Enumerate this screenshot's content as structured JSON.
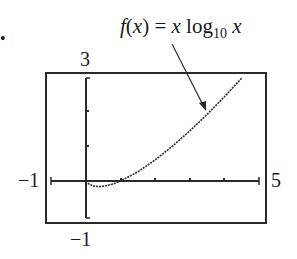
{
  "figure": {
    "bullet": "•",
    "annotation": {
      "func_name": "f",
      "var": "x",
      "equals": " = ",
      "log_text": "log",
      "log_base": "10",
      "text": "f(x) = x log10 x"
    },
    "labels": {
      "ymax": "3",
      "ymin": "−1",
      "xmin": "−1",
      "xmax": "5"
    }
  },
  "chart_data": {
    "type": "line",
    "title": "f(x) = x log10 x",
    "xlabel": "",
    "ylabel": "",
    "xlim": [
      -1,
      5
    ],
    "ylim": [
      -1,
      3
    ],
    "grid": false,
    "x_ticks": [
      0,
      1,
      2,
      3,
      4,
      5
    ],
    "y_ticks": [
      -1,
      0,
      1,
      2,
      3
    ],
    "series": [
      {
        "name": "f(x) = x log10 x",
        "x": [
          0.05,
          0.2,
          0.37,
          0.5,
          0.75,
          1.0,
          1.5,
          2.0,
          2.5,
          3.0,
          3.5,
          4.0,
          4.5
        ],
        "values": [
          -0.065,
          -0.14,
          -0.16,
          -0.15,
          -0.094,
          0.0,
          0.264,
          0.602,
          0.995,
          1.431,
          1.904,
          2.408,
          2.94
        ]
      }
    ],
    "annotations": [
      {
        "text": "f(x) = x log10 x",
        "arrow_to": [
          3.5,
          1.904
        ]
      }
    ]
  }
}
